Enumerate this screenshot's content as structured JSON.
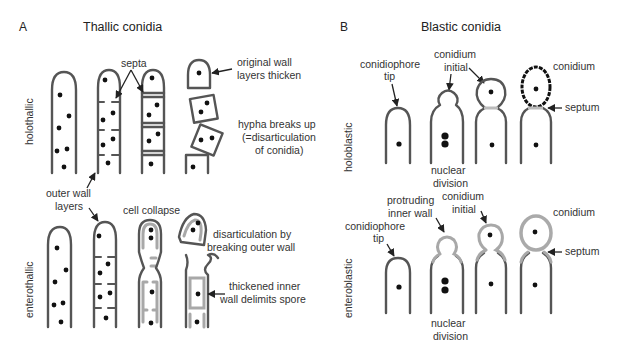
{
  "figure": {
    "panels": [
      {
        "letter": "A",
        "title": "Thallic conidia",
        "rows": [
          {
            "name": "holothallic",
            "labels": {
              "septa": "septa",
              "original_wall_1": "original wall",
              "original_wall_2": "layers thicken",
              "hypha_breaks_1": "hypha breaks up",
              "hypha_breaks_2": "(=disarticulation",
              "hypha_breaks_3": "of conidia)"
            }
          },
          {
            "name": "enterothallic",
            "labels": {
              "outer_wall_1": "outer wall",
              "outer_wall_2": "layers",
              "cell_collapse": "cell collapse",
              "disarticulation_1": "disarticulation by",
              "disarticulation_2": "breaking outer wall",
              "thickened_1": "thickened inner",
              "thickened_2": "wall delimits spore"
            }
          }
        ]
      },
      {
        "letter": "B",
        "title": "Blastic conidia",
        "rows": [
          {
            "name": "holoblastic",
            "labels": {
              "conidiophore_1": "conidiophore",
              "conidiophore_2": "tip",
              "conidium_initial_1": "conidium",
              "conidium_initial_2": "initial",
              "conidium": "conidium",
              "septum": "septum",
              "nuclear_1": "nuclear",
              "nuclear_2": "division"
            }
          },
          {
            "name": "enteroblastic",
            "labels": {
              "protruding_1": "protruding",
              "protruding_2": "inner wall",
              "conidium_initial_1": "conidium",
              "conidium_initial_2": "initial",
              "conidiophore_1": "conidiophore",
              "conidiophore_2": "tip",
              "conidium": "conidium",
              "septum": "septum",
              "nuclear_1": "nuclear",
              "nuclear_2": "division"
            }
          }
        ]
      }
    ],
    "colors": {
      "wall": "#555555",
      "inner_wall": "#a8a8a8",
      "nucleus": "#111111",
      "text": "#333333"
    }
  }
}
